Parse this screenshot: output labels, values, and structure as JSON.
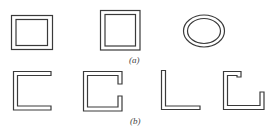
{
  "figure": {
    "group_a": {
      "label": "(a)",
      "shapes": [
        {
          "name": "hollow-rectangular-section"
        },
        {
          "name": "hollow-square-section"
        },
        {
          "name": "hollow-elliptical-section"
        }
      ]
    },
    "group_b": {
      "label": "(b)",
      "shapes": [
        {
          "name": "channel-section"
        },
        {
          "name": "lipped-channel-section"
        },
        {
          "name": "angle-section"
        },
        {
          "name": "lipped-angle-section"
        }
      ]
    },
    "colors": {
      "line": "#3a3a3a",
      "background": "#ffffff"
    }
  }
}
